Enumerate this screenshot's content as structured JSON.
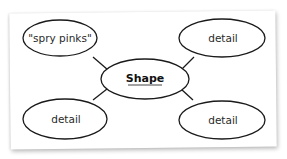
{
  "diagram": {
    "type": "semantic-feature-map",
    "center": {
      "label": "Shape",
      "underlined": true
    },
    "nodes": [
      {
        "position": "top-left",
        "label": "\"spry pinks\""
      },
      {
        "position": "top-right",
        "label": "detail"
      },
      {
        "position": "bottom-left",
        "label": "detail"
      },
      {
        "position": "bottom-right",
        "label": "detail"
      }
    ],
    "colors": {
      "stroke": "#1a1a1a",
      "paper": "#ffffff",
      "text": "#2a2a2a"
    }
  }
}
